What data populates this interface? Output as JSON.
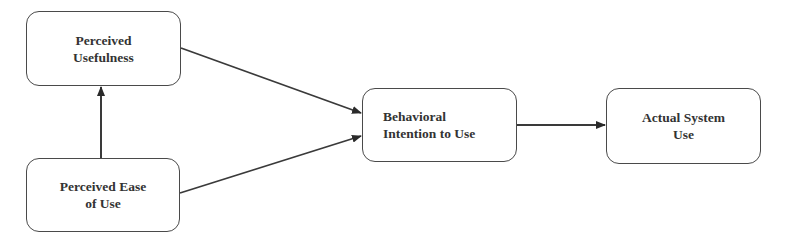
{
  "diagram": {
    "type": "flowchart",
    "title": "",
    "nodes": [
      {
        "id": "pu",
        "label": "Perceived\nUsefulness"
      },
      {
        "id": "peou",
        "label": "Perceived Ease\nof Use"
      },
      {
        "id": "bi",
        "label": "Behavioral\nIntention to Use"
      },
      {
        "id": "asu",
        "label": "Actual System\nUse"
      }
    ],
    "edges": [
      {
        "from": "peou",
        "to": "pu"
      },
      {
        "from": "pu",
        "to": "bi"
      },
      {
        "from": "peou",
        "to": "bi"
      },
      {
        "from": "bi",
        "to": "asu"
      }
    ],
    "colors": {
      "stroke": "#3a3a3a",
      "text": "#333333",
      "background": "#ffffff"
    }
  }
}
